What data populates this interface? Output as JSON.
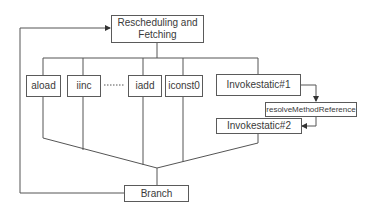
{
  "diagram": {
    "type": "flowchart",
    "colors": {
      "line": "#555555",
      "box_border": "#5a5a5a",
      "text": "#3a3a3a",
      "background": "#ffffff"
    },
    "nodes": {
      "top": {
        "label": "Rescheduling and Fetching",
        "line1": "Rescheduling and",
        "line2": "Fetching"
      },
      "aload": {
        "label": "aload"
      },
      "iinc": {
        "label": "iinc"
      },
      "iadd": {
        "label": "iadd"
      },
      "iconst0": {
        "label": "iconst0"
      },
      "invokestatic1": {
        "label": "Invokestatic#1"
      },
      "resolve": {
        "label": "resolveMethodReference"
      },
      "invokestatic2": {
        "label": "Invokestatic#2"
      },
      "branch": {
        "label": "Branch"
      }
    },
    "edges": [
      {
        "from": "Rescheduling and Fetching",
        "to": [
          "aload",
          "iinc",
          "iadd",
          "iconst0",
          "Invokestatic#1"
        ]
      },
      {
        "from": "Invokestatic#1",
        "to": "resolveMethodReference",
        "arrow": true
      },
      {
        "from": "resolveMethodReference",
        "to": "Invokestatic#2",
        "arrow": true
      },
      {
        "from": [
          "aload",
          "iinc",
          "iadd",
          "iconst0",
          "Invokestatic#2"
        ],
        "to": "Branch"
      },
      {
        "from": "Branch",
        "to": "Rescheduling and Fetching",
        "arrow": true,
        "note": "loop back"
      }
    ],
    "ellipsis": "dotted line between iinc and iadd"
  }
}
